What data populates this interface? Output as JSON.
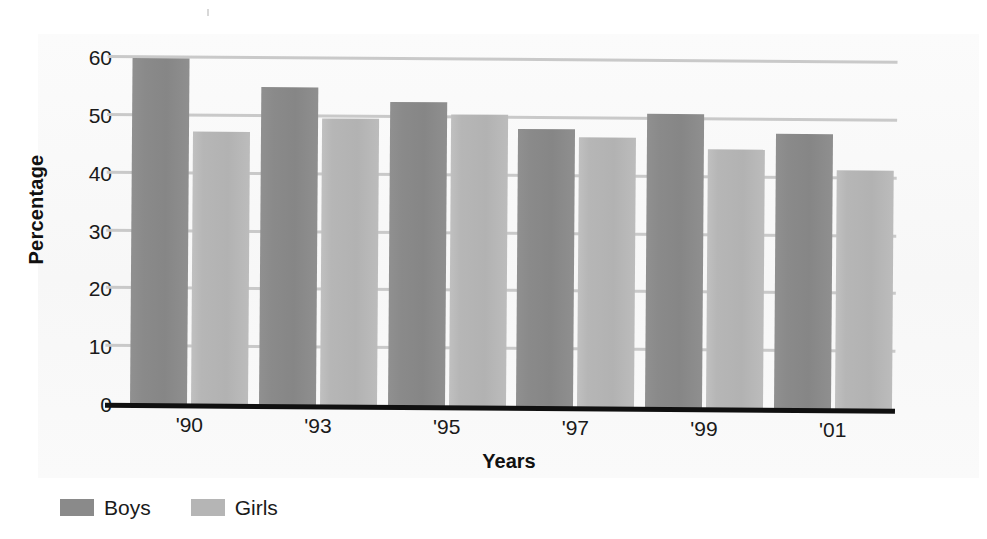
{
  "chart_data": {
    "type": "bar",
    "title": "",
    "xlabel": "Years",
    "ylabel": "Percentage",
    "categories": [
      "'90",
      "'93",
      "'95",
      "'97",
      "'99",
      "'01"
    ],
    "series": [
      {
        "name": "Boys",
        "color": "#8a8a8a",
        "values": [
          60.0,
          55.2,
          52.8,
          48.3,
          51.0,
          47.8
        ]
      },
      {
        "name": "Girls",
        "color": "#b5b5b5",
        "values": [
          47.3,
          49.8,
          50.6,
          46.9,
          45.0,
          41.5
        ]
      }
    ],
    "ylim": [
      0,
      60
    ],
    "ytick_labels": [
      "0",
      "10",
      "20",
      "30",
      "40",
      "50",
      "60"
    ],
    "ytick_values": [
      0,
      10,
      20,
      30,
      40,
      50,
      60
    ],
    "grid": true,
    "grid_axis": "y",
    "grid_color": "#c9c9c9",
    "axis_color": "#101010",
    "legend_position": "bottom-left",
    "background_color": "#f9f9f9"
  },
  "legend": {
    "items": [
      {
        "label": "Boys",
        "color": "#8a8a8a"
      },
      {
        "label": "Girls",
        "color": "#b5b5b5"
      }
    ]
  }
}
